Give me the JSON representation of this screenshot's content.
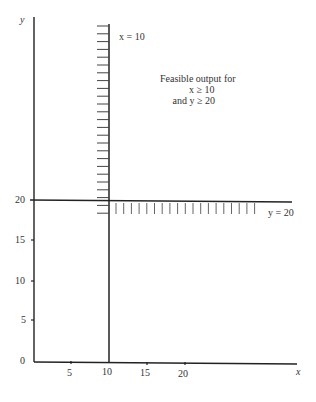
{
  "axes": {
    "x_label": "x",
    "y_label": "y",
    "x_ticks": [
      "5",
      "10",
      "15",
      "20"
    ],
    "y_ticks": [
      "0",
      "5",
      "10",
      "15",
      "20"
    ]
  },
  "constraints": {
    "vertical_line_label": "x = 10",
    "horizontal_line_label": "y = 20"
  },
  "annotation": {
    "line1": "Feasible output for",
    "line2": "x ≥ 10",
    "line3": "and y ≥ 20"
  },
  "colors": {
    "ink": "#222222",
    "hatch": "#555555",
    "background": "#ffffff"
  }
}
